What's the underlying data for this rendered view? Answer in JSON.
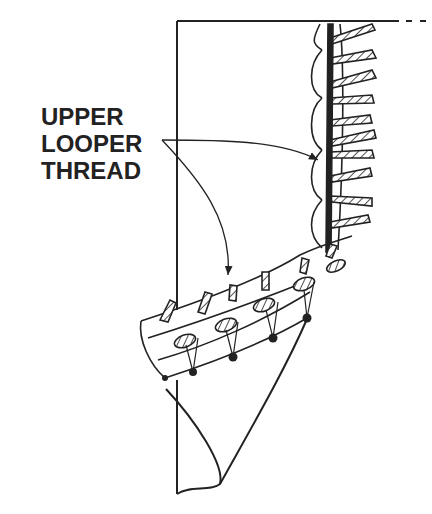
{
  "diagram": {
    "type": "technical-illustration",
    "label": {
      "lines": [
        "UPPER",
        "LOOPER",
        "THREAD"
      ]
    },
    "callouts": [
      {
        "target": "upper looper thread on vertical seam",
        "from": "label"
      },
      {
        "target": "upper looper thread on curved hem edge",
        "from": "label"
      }
    ],
    "colors": {
      "line": "#222222",
      "background": "#ffffff"
    }
  }
}
